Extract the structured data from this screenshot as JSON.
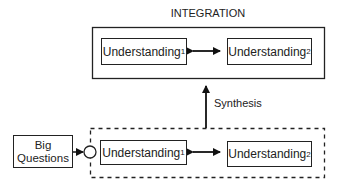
{
  "title": "INTEGRATION",
  "integration": {
    "left": {
      "text": "Understanding",
      "sub": "1"
    },
    "right": {
      "text": "Understanding",
      "sub": "2"
    }
  },
  "synthesis_label": "Synthesis",
  "big_questions": {
    "line1": "Big",
    "line2": "Questions"
  },
  "exploration": {
    "left": {
      "text": "Understanding",
      "sub": "1"
    },
    "right": {
      "text": "Understanding",
      "sub": "2"
    }
  }
}
